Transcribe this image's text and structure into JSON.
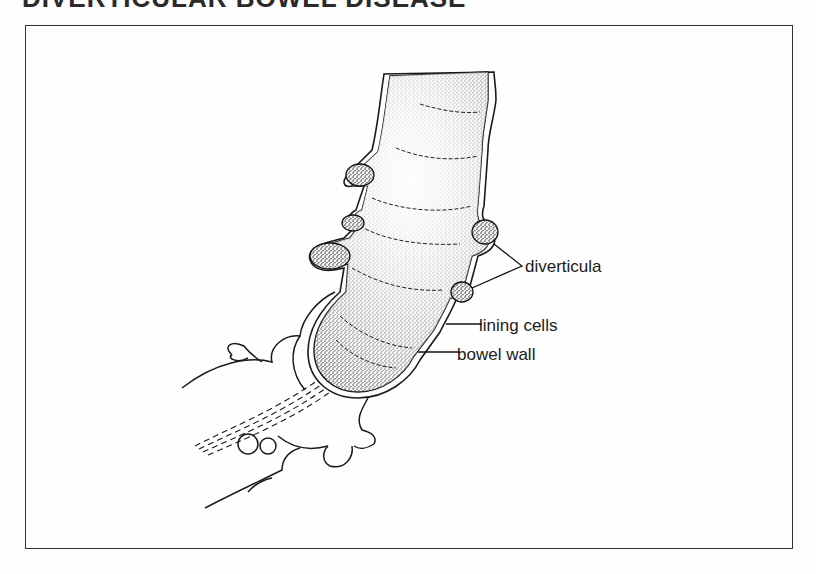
{
  "title": "DIVERTICULAR BOWEL DISEASE",
  "figure": {
    "labels": {
      "diverticula": "diverticula",
      "lining_cells": "lining cells",
      "bowel_wall": "bowel wall"
    }
  },
  "colors": {
    "ink": "#1a1a1a",
    "background": "#fdfdfd",
    "frame": "#333333"
  }
}
